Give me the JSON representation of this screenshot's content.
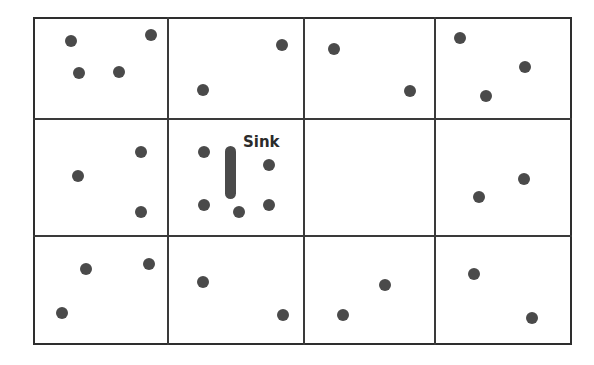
{
  "figure": {
    "title": "",
    "type": "spatial-grid-diagram"
  },
  "labels": {
    "sink": "Sink"
  },
  "colors": {
    "point": "#4a4a4a",
    "sink": "#4a4a4a",
    "grid_line": "#3a3a3a",
    "frame": "#2e2e2e",
    "background": "#ffffff",
    "text": "#2b2b2b"
  },
  "chart_data": {
    "type": "scatter",
    "title": "",
    "xlabel": "",
    "ylabel": "",
    "grid": true,
    "legend": false,
    "xlim": [
      33,
      572
    ],
    "ylim": [
      17,
      345
    ],
    "grid_columns": 4,
    "grid_rows": 3,
    "frame": {
      "x": 33,
      "y": 17,
      "width": 539,
      "height": 328
    },
    "vertical_gridlines": [
      167,
      303,
      434
    ],
    "horizontal_gridlines": [
      118,
      235
    ],
    "cell_counts": [
      [
        4,
        2,
        2,
        3
      ],
      [
        3,
        5,
        0,
        2
      ],
      [
        3,
        2,
        2,
        2
      ]
    ],
    "total_points": 30,
    "point_radius": 6,
    "points": [
      {
        "x": 71,
        "y": 41,
        "cell": "r1c1"
      },
      {
        "x": 151,
        "y": 35,
        "cell": "r1c1"
      },
      {
        "x": 79,
        "y": 73,
        "cell": "r1c1"
      },
      {
        "x": 119,
        "y": 72,
        "cell": "r1c1"
      },
      {
        "x": 282,
        "y": 45,
        "cell": "r1c2"
      },
      {
        "x": 203,
        "y": 90,
        "cell": "r1c2"
      },
      {
        "x": 334,
        "y": 49,
        "cell": "r1c3"
      },
      {
        "x": 410,
        "y": 91,
        "cell": "r1c3"
      },
      {
        "x": 460,
        "y": 38,
        "cell": "r1c4"
      },
      {
        "x": 525,
        "y": 67,
        "cell": "r1c4"
      },
      {
        "x": 486,
        "y": 96,
        "cell": "r1c4"
      },
      {
        "x": 141,
        "y": 152,
        "cell": "r2c1"
      },
      {
        "x": 78,
        "y": 176,
        "cell": "r2c1"
      },
      {
        "x": 141,
        "y": 212,
        "cell": "r2c1"
      },
      {
        "x": 204,
        "y": 152,
        "cell": "r2c2"
      },
      {
        "x": 269,
        "y": 165,
        "cell": "r2c2"
      },
      {
        "x": 204,
        "y": 205,
        "cell": "r2c2"
      },
      {
        "x": 239,
        "y": 212,
        "cell": "r2c2"
      },
      {
        "x": 269,
        "y": 205,
        "cell": "r2c2"
      },
      {
        "x": 524,
        "y": 179,
        "cell": "r2c4"
      },
      {
        "x": 479,
        "y": 197,
        "cell": "r2c4"
      },
      {
        "x": 86,
        "y": 269,
        "cell": "r3c1"
      },
      {
        "x": 149,
        "y": 264,
        "cell": "r3c1"
      },
      {
        "x": 62,
        "y": 313,
        "cell": "r3c1"
      },
      {
        "x": 203,
        "y": 282,
        "cell": "r3c2"
      },
      {
        "x": 283,
        "y": 315,
        "cell": "r3c2"
      },
      {
        "x": 385,
        "y": 285,
        "cell": "r3c3"
      },
      {
        "x": 343,
        "y": 315,
        "cell": "r3c3"
      },
      {
        "x": 474,
        "y": 274,
        "cell": "r3c4"
      },
      {
        "x": 532,
        "y": 318,
        "cell": "r3c4"
      }
    ],
    "sink": {
      "label": "Sink",
      "cell": "r2c2",
      "shape": "vertical-rounded-bar",
      "x": 225,
      "y": 146,
      "width": 11,
      "height": 53,
      "label_x": 243,
      "label_y": 133,
      "label_font_size": 15
    }
  }
}
